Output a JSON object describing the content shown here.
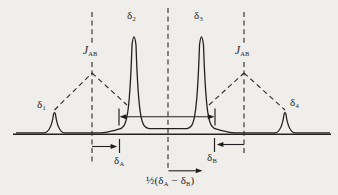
{
  "figure": {
    "kind": "NMR AB-quartet spectrum schematic",
    "background_color": "#f0eeea",
    "ink_color": "#222222",
    "labels": {
      "peak1": {
        "base": "δ",
        "sub": "1"
      },
      "peak2": {
        "base": "δ",
        "sub": "2"
      },
      "peak3": {
        "base": "δ",
        "sub": "3"
      },
      "peak4": {
        "base": "δ",
        "sub": "4"
      },
      "coupling_left": {
        "base": "J",
        "sub": "AB"
      },
      "coupling_right": {
        "base": "J",
        "sub": "AB"
      },
      "shift_a": {
        "base": "δ",
        "sub": "A"
      },
      "shift_b": {
        "base": "δ",
        "sub": "B"
      },
      "half_difference": {
        "prefix": "½(δ",
        "sub_a": "A",
        "minus": " − δ",
        "sub_b": "B",
        "suffix": ")"
      }
    }
  }
}
